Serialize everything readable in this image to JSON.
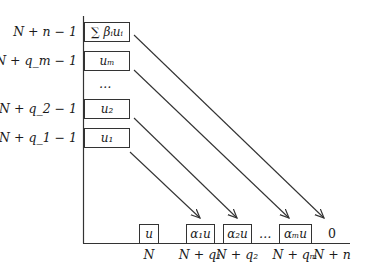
{
  "diagram": {
    "y_axis_labels": [
      {
        "id": "n",
        "text": "N + n − 1"
      },
      {
        "id": "qm",
        "text": "N + q_m − 1"
      },
      {
        "id": "q2",
        "text": "N + q_2 − 1"
      },
      {
        "id": "q1",
        "text": "N + q_1 − 1"
      }
    ],
    "left_boxes": [
      {
        "id": "sum",
        "text": "∑ βᵢuᵢ"
      },
      {
        "id": "um",
        "text": "uₘ"
      },
      {
        "id": "u2",
        "text": "u₂"
      },
      {
        "id": "u1",
        "text": "u₁"
      }
    ],
    "left_ellipsis": "…",
    "bottom_boxes": [
      {
        "id": "u",
        "text": "u"
      },
      {
        "id": "a1u",
        "text": "α₁u"
      },
      {
        "id": "a2u",
        "text": "α₂u"
      },
      {
        "id": "amu",
        "text": "αₘu"
      }
    ],
    "bottom_ellipsis": "…",
    "bottom_zero": "0",
    "x_axis_labels": [
      {
        "id": "N",
        "text": "N"
      },
      {
        "id": "q1",
        "text": "N + q₁"
      },
      {
        "id": "q2",
        "text": "N + q₂"
      },
      {
        "id": "qm",
        "text": "N + qₘ"
      },
      {
        "id": "n",
        "text": "N + n"
      }
    ],
    "arrows": [
      {
        "from": "∑ βᵢuᵢ",
        "to": "0"
      },
      {
        "from": "uₘ",
        "to": "αₘu"
      },
      {
        "from": "u₂",
        "to": "α₂u"
      },
      {
        "from": "u₁",
        "to": "α₁u"
      }
    ],
    "line_color": "#333333"
  }
}
